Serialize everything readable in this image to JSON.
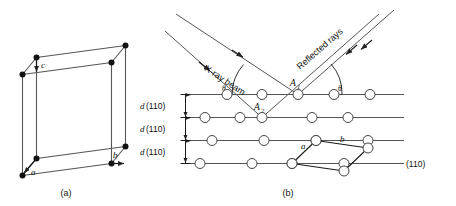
{
  "figure": {
    "captions": {
      "left": "(a)",
      "right": "(b)"
    }
  },
  "unit_cell": {
    "name": "orthorhombic-unit-cell",
    "axis_labels": {
      "a": "a",
      "b": "b",
      "c": "c"
    },
    "vertex_count": 8,
    "colors": {
      "edge": "#555555",
      "vertex": "#111111"
    }
  },
  "diffraction": {
    "incident_label": "X-ray beam",
    "reflected_label": "Reflected rays",
    "angle_label": "θ",
    "angle_labels": [
      "θ",
      "θ"
    ],
    "point_labels": {
      "a1": "A",
      "a1_sub": "1",
      "a2": "A",
      "a2_sub": "2"
    },
    "spacing_labels": [
      {
        "d": "d",
        "hkl": "(110)"
      },
      {
        "d": "d",
        "hkl": "(110)"
      },
      {
        "d": "d",
        "hkl": "(110)"
      }
    ],
    "plane_label": "(110)",
    "cell_edge_labels": {
      "a": "a",
      "b": "b"
    },
    "plane_rows": 4,
    "atoms_per_row": 5,
    "colors": {
      "ray": "#666666",
      "plane": "#555555",
      "atom_fill": "#ffffff",
      "atom_stroke": "#444444"
    }
  }
}
